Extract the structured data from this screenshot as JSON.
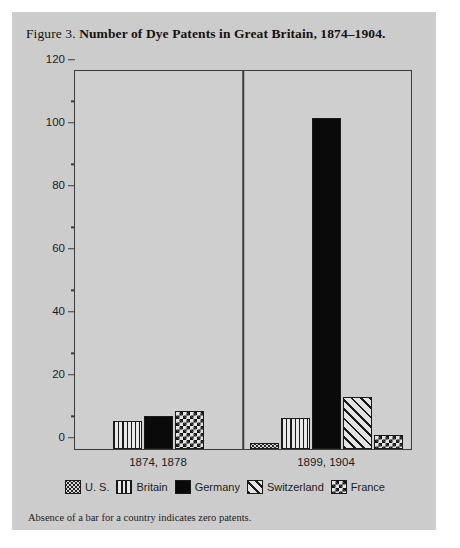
{
  "figure": {
    "label": "Figure 3.",
    "title": "Number of Dye Patents in Great Britain, 1874–1904.",
    "footnote": "Absence of a bar for a country indicates zero patents."
  },
  "legend": [
    {
      "label": "U. S.",
      "pattern": "dotted-swatch-icon",
      "color": "#d6d6d6"
    },
    {
      "label": "Britain",
      "pattern": "vertical-lines-swatch-icon",
      "color": "#e2e2e2"
    },
    {
      "label": "Germany",
      "pattern": "solid-black-swatch-icon",
      "color": "#0a0a0a"
    },
    {
      "label": "Switzerland",
      "pattern": "diagonal-hatch-swatch-icon",
      "color": "#e0e0e0"
    },
    {
      "label": "France",
      "pattern": "checkerboard-swatch-icon",
      "color": "#e4e4e4"
    }
  ],
  "axis": {
    "y_ticks_major": [
      0,
      20,
      40,
      60,
      80,
      100,
      120
    ],
    "y_ticks_minor": [
      10,
      30,
      50,
      70,
      90,
      110
    ]
  },
  "chart_data": {
    "type": "bar",
    "title": "Number of Dye Patents in Great Britain, 1874–1904.",
    "xlabel": "",
    "ylabel": "",
    "ylim": [
      0,
      120
    ],
    "ytick_interval": 20,
    "yminor_tick_interval": 10,
    "grid": false,
    "legend_position": "bottom",
    "group_divider": true,
    "categories": [
      "1874, 1878",
      "1899, 1904"
    ],
    "series": [
      {
        "name": "U. S.",
        "values": [
          0,
          2
        ]
      },
      {
        "name": "Britain",
        "values": [
          9,
          10
        ]
      },
      {
        "name": "Germany",
        "values": [
          10.5,
          105
        ]
      },
      {
        "name": "Switzerland",
        "values": [
          0,
          16.5
        ]
      },
      {
        "name": "France",
        "values": [
          12,
          4.5
        ]
      }
    ],
    "note": "Absence of a bar for a country indicates zero patents."
  }
}
